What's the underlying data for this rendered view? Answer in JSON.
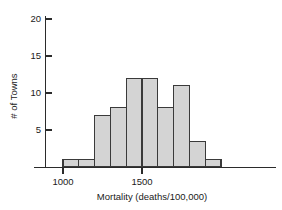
{
  "chart_data": {
    "type": "bar",
    "title": "",
    "subtitle": "",
    "xlabel": "Mortality (deaths/100,000)",
    "ylabel": "# of Towns",
    "xlim": [
      900,
      2000
    ],
    "ylim": [
      0,
      21.5
    ],
    "bin_width": 100,
    "grid": false,
    "legend": null,
    "x_tick_labels": [
      "1000",
      "1500"
    ],
    "x_ticks": [
      1000,
      1500
    ],
    "y_tick_labels": [
      "5",
      "10",
      "15",
      "20"
    ],
    "y_ticks": [
      5,
      10,
      15,
      20
    ],
    "bins": [
      {
        "start": 1000,
        "end": 1100,
        "count": 1
      },
      {
        "start": 1100,
        "end": 1200,
        "count": 1
      },
      {
        "start": 1200,
        "end": 1300,
        "count": 7
      },
      {
        "start": 1300,
        "end": 1400,
        "count": 8
      },
      {
        "start": 1400,
        "end": 1500,
        "count": 12
      },
      {
        "start": 1500,
        "end": 1600,
        "count": 12
      },
      {
        "start": 1600,
        "end": 1700,
        "count": 8
      },
      {
        "start": 1700,
        "end": 1800,
        "count": 11
      },
      {
        "start": 1800,
        "end": 1900,
        "count": 3.4
      },
      {
        "start": 1900,
        "end": 2000,
        "count": 1
      }
    ],
    "categories": [
      "1000-1100",
      "1100-1200",
      "1200-1300",
      "1300-1400",
      "1400-1500",
      "1500-1600",
      "1600-1700",
      "1700-1800",
      "1800-1900",
      "1900-2000"
    ],
    "values": [
      1,
      1,
      7,
      8,
      12,
      12,
      8,
      11,
      3.4,
      1
    ],
    "colors": {
      "bar_fill": "#d4d4d4",
      "bar_stroke": "#3a3a3a",
      "axis": "#2b2b2b",
      "text": "#1a1a1a",
      "background": "#ffffff"
    }
  }
}
